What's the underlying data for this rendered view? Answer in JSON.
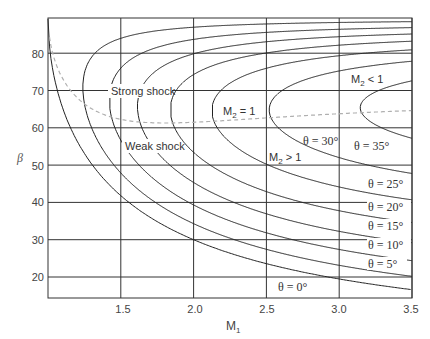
{
  "chart_data": {
    "type": "line",
    "title": "",
    "xlabel": "M1",
    "ylabel": "β",
    "xlim": [
      1.0,
      3.5
    ],
    "ylim": [
      15,
      90
    ],
    "grid": true,
    "x_ticks": [
      "1.5",
      "2.0",
      "2.5",
      "3.0",
      "3.5"
    ],
    "y_ticks": [
      "20",
      "30",
      "40",
      "50",
      "60",
      "70",
      "80"
    ],
    "gamma": 1.4,
    "series": [
      {
        "name": "θ = 0°",
        "theta": 0
      },
      {
        "name": "θ = 5°",
        "theta": 5
      },
      {
        "name": "θ = 10°",
        "theta": 10
      },
      {
        "name": "θ = 15°",
        "theta": 15
      },
      {
        "name": "θ = 20°",
        "theta": 20
      },
      {
        "name": "θ = 25°",
        "theta": 25
      },
      {
        "name": "θ = 30°",
        "theta": 30
      },
      {
        "name": "θ = 35°",
        "theta": 35
      }
    ],
    "dashed_curves": [
      {
        "name": "M2 = 1 (sonic line)",
        "style": "dashed",
        "color": "#b0b0b0"
      }
    ],
    "annotations": [
      {
        "text": "Strong shock",
        "x": 1.62,
        "y": 70
      },
      {
        "text": "Weak shock",
        "x": 1.68,
        "y": 55.5
      },
      {
        "text": "M2 = 1",
        "x": 2.25,
        "y": 66
      },
      {
        "text": "M2 > 1",
        "x": 2.55,
        "y": 54
      },
      {
        "text": "M2 < 1",
        "x": 3.18,
        "y": 76.5
      },
      {
        "text": "θ = 30°",
        "x": 2.68,
        "y": 59
      },
      {
        "text": "θ = 35°",
        "x": 3.12,
        "y": 55.5
      },
      {
        "text": "θ = 25°",
        "x": 3.38,
        "y": 46
      },
      {
        "text": "θ = 20°",
        "x": 3.38,
        "y": 40
      },
      {
        "text": "θ = 15°",
        "x": 3.38,
        "y": 34.5
      },
      {
        "text": "θ = 10°",
        "x": 3.38,
        "y": 29
      },
      {
        "text": "θ = 5°",
        "x": 3.38,
        "y": 24
      },
      {
        "text": "θ = 0°",
        "x": 2.78,
        "y": 18.5
      }
    ]
  },
  "labels": {
    "x_axis": "M",
    "x_axis_sub": "1",
    "y_axis": "β",
    "strong_shock": "Strong shock",
    "weak_shock": "Weak shock",
    "m2_eq1": "M",
    "m2_eq1_rest": " = 1",
    "m2_gt1_rest": " > 1",
    "m2_lt1_rest": " < 1",
    "m2_sub": "2",
    "theta_30": "θ = 30°",
    "theta_35": "θ = 35°",
    "theta_25": "θ = 25°",
    "theta_20": "θ = 20°",
    "theta_15": "θ = 15°",
    "theta_10": "θ = 10°",
    "theta_5": "θ = 5°",
    "theta_0": "θ = 0°"
  },
  "ticks": {
    "x": [
      "1.5",
      "2.0",
      "2.5",
      "3.0",
      "3.5"
    ],
    "y": [
      "80",
      "70",
      "60",
      "50",
      "40",
      "30",
      "20"
    ]
  }
}
